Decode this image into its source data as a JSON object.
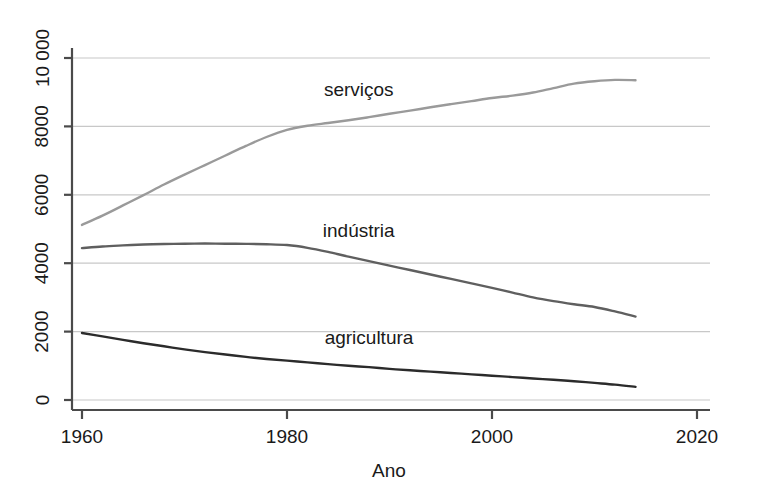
{
  "chart_data": {
    "type": "line",
    "title": "",
    "xlabel": "Ano",
    "ylabel": "",
    "xlim": [
      1960,
      2020
    ],
    "ylim": [
      0,
      10000
    ],
    "grid": true,
    "legend_position": "inline-labels",
    "x_ticks": [
      "1960",
      "1980",
      "2000",
      "2020"
    ],
    "x_tick_values": [
      1960,
      1980,
      2000,
      2020
    ],
    "y_ticks": [
      "0",
      "2000",
      "4000",
      "6000",
      "8000",
      "10 000"
    ],
    "y_tick_values": [
      0,
      2000,
      4000,
      6000,
      8000,
      10000
    ],
    "y_tick_rotation": "-90",
    "series": [
      {
        "name": "serviços",
        "color": "#9a9a9a",
        "label_x": 1987,
        "label_y": 8900,
        "x": [
          1960,
          1962,
          1964,
          1966,
          1968,
          1970,
          1972,
          1974,
          1976,
          1978,
          1980,
          1982,
          1984,
          1986,
          1988,
          1990,
          1992,
          1994,
          1996,
          1998,
          2000,
          2002,
          2004,
          2006,
          2008,
          2010,
          2012,
          2014
        ],
        "values": [
          5120,
          5390,
          5690,
          5990,
          6300,
          6590,
          6870,
          7150,
          7430,
          7690,
          7900,
          8020,
          8100,
          8180,
          8270,
          8370,
          8460,
          8560,
          8650,
          8740,
          8830,
          8900,
          8990,
          9120,
          9250,
          9320,
          9360,
          9350
        ]
      },
      {
        "name": "indústria",
        "color": "#5f5f5f",
        "label_x": 1987,
        "label_y": 4760,
        "x": [
          1960,
          1962,
          1964,
          1966,
          1968,
          1970,
          1972,
          1974,
          1976,
          1978,
          1980,
          1982,
          1984,
          1986,
          1988,
          1990,
          1992,
          1994,
          1996,
          1998,
          2000,
          2002,
          2004,
          2006,
          2008,
          2010,
          2012,
          2014
        ],
        "values": [
          4440,
          4490,
          4520,
          4545,
          4560,
          4570,
          4575,
          4570,
          4565,
          4555,
          4530,
          4450,
          4330,
          4190,
          4060,
          3930,
          3800,
          3670,
          3540,
          3410,
          3280,
          3140,
          3000,
          2890,
          2800,
          2720,
          2590,
          2440
        ]
      },
      {
        "name": "agricultura",
        "color": "#2b2b2b",
        "label_x": 1988,
        "label_y": 1640,
        "x": [
          1960,
          1962,
          1964,
          1966,
          1968,
          1970,
          1972,
          1974,
          1976,
          1978,
          1980,
          1982,
          1984,
          1986,
          1988,
          1990,
          1992,
          1994,
          1996,
          1998,
          2000,
          2002,
          2004,
          2006,
          2008,
          2010,
          2012,
          2014
        ],
        "values": [
          1960,
          1860,
          1760,
          1660,
          1570,
          1480,
          1400,
          1330,
          1260,
          1200,
          1150,
          1100,
          1050,
          1000,
          960,
          910,
          870,
          830,
          790,
          750,
          710,
          670,
          630,
          590,
          550,
          500,
          450,
          385
        ]
      }
    ]
  },
  "axes": {
    "x_axis_name": "x-axis",
    "y_axis_name": "y-axis",
    "grid_color": "#c8c8c8",
    "axis_color": "#4a4a4a"
  }
}
